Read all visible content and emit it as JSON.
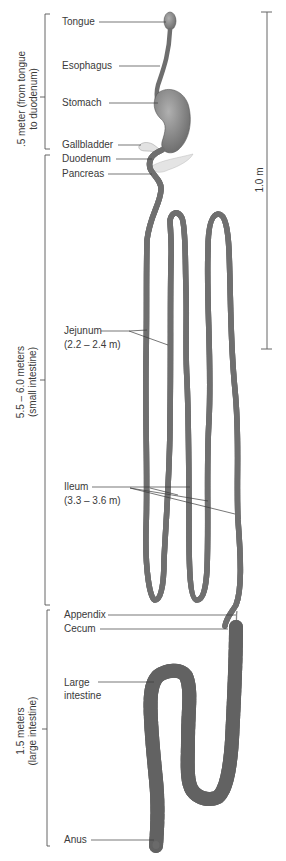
{
  "figure": {
    "colors": {
      "tube": "#9a9a9a",
      "tube_dark": "#6f6f6f",
      "tube_light": "#d4d4d4",
      "line": "#4a4a4a",
      "pancreas": "#dcdcdc"
    }
  },
  "sections": [
    {
      "id": "upper",
      "line1": ".5 meter (from tongue",
      "line2": "to duodenum)"
    },
    {
      "id": "small",
      "line1": "5.5 – 6.0 meters",
      "line2": "(small intestine)"
    },
    {
      "id": "large",
      "line1": "1.5 meters",
      "line2": "(large intestine)"
    }
  ],
  "scale_bar": {
    "label": "1.0 m"
  },
  "labels": {
    "tongue": "Tongue",
    "esophagus": "Esophagus",
    "stomach": "Stomach",
    "gallbladder": "Gallbladder",
    "duodenum": "Duodenum",
    "pancreas": "Pancreas",
    "jejunum": "Jejunum",
    "jejunum_len": "(2.2 – 2.4 m)",
    "ileum": "Ileum",
    "ileum_len": "(3.3 – 3.6 m)",
    "appendix": "Appendix",
    "cecum": "Cecum",
    "large_intestine_1": "Large",
    "large_intestine_2": "intestine",
    "anus": "Anus"
  }
}
